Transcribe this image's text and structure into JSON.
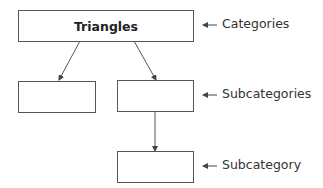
{
  "diagram": {
    "type": "hierarchy",
    "nodes": [
      {
        "id": "root",
        "label": "Triangles",
        "level": "category"
      },
      {
        "id": "sub-left",
        "label": "",
        "level": "subcategory"
      },
      {
        "id": "sub-right",
        "label": "",
        "level": "subcategory"
      },
      {
        "id": "subsub",
        "label": "",
        "level": "subcategory-child"
      }
    ],
    "edges": [
      {
        "from": "root",
        "to": "sub-left"
      },
      {
        "from": "root",
        "to": "sub-right"
      },
      {
        "from": "sub-right",
        "to": "subsub"
      }
    ],
    "level_labels": {
      "categories": "Categories",
      "subcategories": "Subcategories",
      "subcategory": "Subcategory"
    }
  },
  "colors": {
    "line": "#555555",
    "text": "#222222"
  }
}
